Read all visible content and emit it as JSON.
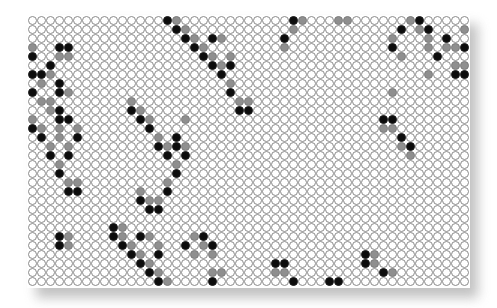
{
  "board": {
    "cols": 49,
    "rows": 30,
    "colors": {
      "empty": "#ffffff",
      "black": "#0d0d0d",
      "gray": "#8f8f8f",
      "outline": "#8a8a8a"
    },
    "black_cells": [
      [
        0,
        15
      ],
      [
        1,
        16
      ],
      [
        2,
        17
      ],
      [
        2,
        20
      ],
      [
        3,
        18
      ],
      [
        4,
        19
      ],
      [
        5,
        20
      ],
      [
        5,
        22
      ],
      [
        6,
        21
      ],
      [
        8,
        22
      ],
      [
        10,
        23
      ],
      [
        10,
        24
      ],
      [
        0,
        29
      ],
      [
        2,
        28
      ],
      [
        0,
        43
      ],
      [
        1,
        41
      ],
      [
        1,
        44
      ],
      [
        2,
        46
      ],
      [
        3,
        40
      ],
      [
        3,
        48
      ],
      [
        4,
        45
      ],
      [
        6,
        47
      ],
      [
        6,
        48
      ],
      [
        3,
        3
      ],
      [
        3,
        4
      ],
      [
        4,
        0
      ],
      [
        5,
        2
      ],
      [
        6,
        0
      ],
      [
        6,
        1
      ],
      [
        7,
        3
      ],
      [
        8,
        0
      ],
      [
        8,
        3
      ],
      [
        10,
        3
      ],
      [
        11,
        3
      ],
      [
        11,
        4
      ],
      [
        12,
        0
      ],
      [
        13,
        1
      ],
      [
        13,
        5
      ],
      [
        15,
        2
      ],
      [
        15,
        4
      ],
      [
        17,
        3
      ],
      [
        19,
        4
      ],
      [
        19,
        5
      ],
      [
        10,
        11
      ],
      [
        11,
        12
      ],
      [
        12,
        13
      ],
      [
        13,
        16
      ],
      [
        14,
        14
      ],
      [
        14,
        16
      ],
      [
        15,
        15
      ],
      [
        15,
        17
      ],
      [
        17,
        16
      ],
      [
        19,
        15
      ],
      [
        20,
        12
      ],
      [
        21,
        13
      ],
      [
        21,
        14
      ],
      [
        11,
        39
      ],
      [
        11,
        40
      ],
      [
        13,
        41
      ],
      [
        14,
        42
      ],
      [
        24,
        3
      ],
      [
        25,
        3
      ],
      [
        23,
        9
      ],
      [
        24,
        9
      ],
      [
        24,
        12
      ],
      [
        25,
        10
      ],
      [
        26,
        11
      ],
      [
        26,
        14
      ],
      [
        27,
        12
      ],
      [
        28,
        13
      ],
      [
        29,
        14
      ],
      [
        24,
        19
      ],
      [
        25,
        17
      ],
      [
        25,
        20
      ],
      [
        29,
        20
      ],
      [
        27,
        27
      ],
      [
        27,
        28
      ],
      [
        29,
        29
      ],
      [
        29,
        33
      ],
      [
        29,
        34
      ],
      [
        26,
        37
      ],
      [
        27,
        37
      ],
      [
        28,
        39
      ]
    ],
    "gray_cells": [
      [
        0,
        16
      ],
      [
        1,
        17
      ],
      [
        2,
        18
      ],
      [
        2,
        21
      ],
      [
        3,
        19
      ],
      [
        4,
        20
      ],
      [
        4,
        22
      ],
      [
        5,
        21
      ],
      [
        7,
        22
      ],
      [
        9,
        23
      ],
      [
        9,
        24
      ],
      [
        0,
        30
      ],
      [
        0,
        34
      ],
      [
        0,
        35
      ],
      [
        1,
        29
      ],
      [
        3,
        28
      ],
      [
        0,
        42
      ],
      [
        1,
        43
      ],
      [
        1,
        48
      ],
      [
        2,
        40
      ],
      [
        2,
        44
      ],
      [
        3,
        44
      ],
      [
        3,
        46
      ],
      [
        3,
        47
      ],
      [
        4,
        41
      ],
      [
        5,
        47
      ],
      [
        5,
        48
      ],
      [
        6,
        44
      ],
      [
        3,
        0
      ],
      [
        4,
        3
      ],
      [
        4,
        4
      ],
      [
        6,
        2
      ],
      [
        7,
        1
      ],
      [
        8,
        4
      ],
      [
        9,
        1
      ],
      [
        9,
        2
      ],
      [
        10,
        2
      ],
      [
        11,
        0
      ],
      [
        12,
        1
      ],
      [
        12,
        3
      ],
      [
        12,
        5
      ],
      [
        13,
        3
      ],
      [
        14,
        2
      ],
      [
        14,
        4
      ],
      [
        16,
        3
      ],
      [
        18,
        4
      ],
      [
        18,
        5
      ],
      [
        9,
        11
      ],
      [
        10,
        12
      ],
      [
        11,
        13
      ],
      [
        11,
        17
      ],
      [
        13,
        14
      ],
      [
        14,
        15
      ],
      [
        14,
        17
      ],
      [
        16,
        16
      ],
      [
        18,
        15
      ],
      [
        19,
        12
      ],
      [
        20,
        13
      ],
      [
        20,
        14
      ],
      [
        8,
        40
      ],
      [
        12,
        39
      ],
      [
        12,
        40
      ],
      [
        14,
        41
      ],
      [
        15,
        42
      ],
      [
        24,
        4
      ],
      [
        25,
        4
      ],
      [
        23,
        10
      ],
      [
        24,
        10
      ],
      [
        24,
        13
      ],
      [
        25,
        11
      ],
      [
        25,
        14
      ],
      [
        26,
        12
      ],
      [
        27,
        13
      ],
      [
        28,
        14
      ],
      [
        29,
        15
      ],
      [
        24,
        18
      ],
      [
        25,
        19
      ],
      [
        26,
        18
      ],
      [
        26,
        20
      ],
      [
        28,
        20
      ],
      [
        28,
        21
      ],
      [
        28,
        27
      ],
      [
        28,
        28
      ],
      [
        26,
        38
      ],
      [
        27,
        38
      ],
      [
        28,
        40
      ]
    ]
  }
}
